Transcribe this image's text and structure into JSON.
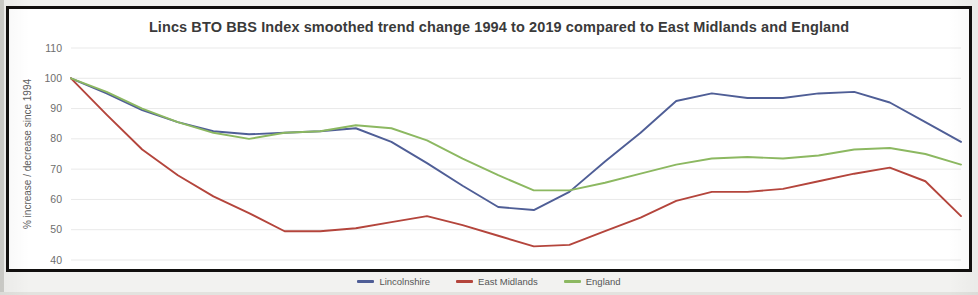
{
  "chart_data": {
    "type": "line",
    "title": "Lincs BTO BBS Index smoothed trend change 1994 to 2019 compared to East Midlands and England",
    "xlabel": "",
    "ylabel": "% increase / decrease since 1994",
    "ylim": [
      40,
      110
    ],
    "yticks": [
      40,
      50,
      60,
      70,
      80,
      90,
      100,
      110
    ],
    "grid": true,
    "legend_position": "bottom",
    "categories": [
      "1994",
      "1995",
      "1996",
      "1997",
      "1998",
      "1999",
      "2000",
      "2001",
      "2002",
      "2003",
      "2004",
      "2005",
      "2006",
      "2007",
      "2008",
      "2009",
      "2010",
      "2011",
      "2012",
      "2013",
      "2014",
      "2015",
      "2016",
      "2017",
      "2018",
      "2019"
    ],
    "series": [
      {
        "name": "Lincolnshire",
        "color": "#4f5e96",
        "values": [
          100,
          95,
          89.5,
          85.5,
          82.5,
          81.5,
          82,
          82.5,
          83.5,
          79,
          72,
          64.5,
          57.5,
          56.5,
          62.5,
          72.5,
          82,
          92.5,
          95,
          93.5,
          93.5,
          95,
          95.5,
          92,
          85.5,
          79
        ]
      },
      {
        "name": "East Midlands",
        "color": "#b4453c",
        "values": [
          100,
          88,
          76.5,
          68,
          61,
          55.5,
          49.5,
          49.5,
          50.5,
          52.5,
          54.5,
          51.5,
          48,
          44.5,
          45,
          49.5,
          54,
          59.5,
          62.5,
          62.5,
          63.5,
          66,
          68.5,
          70.5,
          66,
          54.5
        ]
      },
      {
        "name": "England",
        "color": "#8cb861",
        "values": [
          100,
          95.5,
          90,
          85.5,
          82,
          80,
          82,
          82.5,
          84.5,
          83.5,
          79.5,
          73.5,
          68,
          63,
          63,
          65.5,
          68.5,
          71.5,
          73.5,
          74,
          73.5,
          74.5,
          76.5,
          77,
          75,
          71.5
        ]
      }
    ]
  },
  "legend": {
    "items": [
      {
        "label": "Lincolnshire",
        "color": "#4f5e96"
      },
      {
        "label": "East Midlands",
        "color": "#b4453c"
      },
      {
        "label": "England",
        "color": "#8cb861"
      }
    ]
  }
}
